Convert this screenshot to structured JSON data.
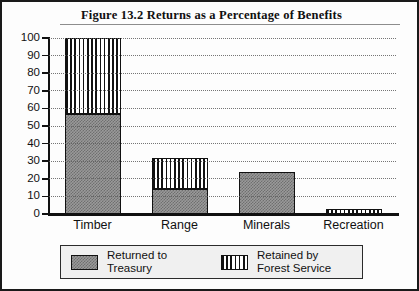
{
  "figure": {
    "title": "Figure 13.2   Returns as a Percentage of Benefits"
  },
  "legend": {
    "entries": [
      {
        "swatch": "solid-gray-swatch",
        "line1": "Returned to",
        "line2": "Treasury"
      },
      {
        "swatch": "vertical-stripe-swatch",
        "line1": "Retained by",
        "line2": "Forest Service"
      }
    ]
  },
  "axis": {
    "y_ticks": [
      "100",
      "90",
      "80",
      "70",
      "60",
      "50",
      "40",
      "30",
      "20",
      "10",
      "0"
    ]
  },
  "colors": {
    "returned_fill": "#9a9a9a",
    "retained_fill": "#ffffff",
    "outline": "#111111",
    "gridline": "#5d5d5d",
    "legend_background": "#f0f0f0"
  },
  "chart_data": {
    "type": "bar",
    "title": "Figure 13.2   Returns as a Percentage of Benefits",
    "xlabel": "",
    "ylabel": "",
    "ylim": [
      0,
      100
    ],
    "yticks": [
      0,
      10,
      20,
      30,
      40,
      50,
      60,
      70,
      80,
      90,
      100
    ],
    "grid": true,
    "stacked": true,
    "legend_position": "below-plot",
    "categories": [
      "Timber",
      "Range",
      "Minerals",
      "Recreation"
    ],
    "series": [
      {
        "name": "Returned to Treasury",
        "values": [
          57,
          14,
          24,
          0
        ]
      },
      {
        "name": "Retained by Forest Service",
        "values": [
          43,
          18,
          0,
          2
        ]
      }
    ],
    "totals": [
      100,
      32,
      24,
      2
    ]
  }
}
